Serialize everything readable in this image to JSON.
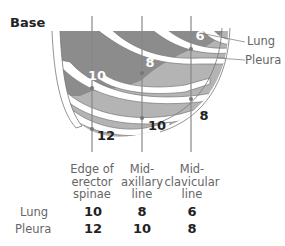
{
  "title": "Base",
  "callouts": {
    "lung": "Lung",
    "pleura": "Pleura"
  },
  "diagram_numbers": {
    "lung": [
      "10",
      "8",
      "6"
    ],
    "pleura": [
      "12",
      "10",
      "8"
    ]
  },
  "columns": [
    {
      "label_lines": [
        "Edge of",
        "erector",
        "spinae"
      ]
    },
    {
      "label_lines": [
        "Mid-",
        "axillary",
        "line"
      ]
    },
    {
      "label_lines": [
        "Mid-",
        "clavicular",
        "line"
      ]
    }
  ],
  "table": {
    "rows": [
      {
        "label": "Lung",
        "values": [
          "10",
          "8",
          "6"
        ]
      },
      {
        "label": "Pleura",
        "values": [
          "12",
          "10",
          "8"
        ]
      }
    ]
  },
  "colors": {
    "lung": "#8c8c8c",
    "pleura": "#b4b4b4",
    "rib": "#ffffff",
    "outline": "#777777",
    "line": "#888888"
  }
}
